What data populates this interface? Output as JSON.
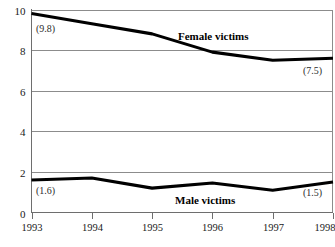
{
  "chart_data": {
    "type": "line",
    "title": "",
    "subtitle": "",
    "xlabel": "",
    "ylabel": "",
    "x": [
      "1993",
      "1994",
      "1995",
      "1996",
      "1997",
      "1998"
    ],
    "categories": [
      "1993",
      "1994",
      "1995",
      "1996",
      "1997",
      "1998"
    ],
    "series": [
      {
        "name": "Female victims",
        "label": "Female victims",
        "values": [
          9.8,
          9.3,
          8.8,
          7.9,
          7.5,
          7.6
        ],
        "endpoint_annotations": {
          "first": "(9.8)",
          "last": "(7.5)"
        }
      },
      {
        "name": "Male victims",
        "label": "Male victims",
        "values": [
          1.6,
          1.7,
          1.2,
          1.45,
          1.1,
          1.5
        ],
        "endpoint_annotations": {
          "first": "(1.6)",
          "last": "(1.5)"
        }
      }
    ],
    "ylim": [
      0,
      10
    ],
    "xlim": [
      "1993",
      "1998"
    ],
    "y_ticks": [
      "0",
      "2",
      "4",
      "6",
      "8",
      "10"
    ],
    "y_tick_values": [
      0,
      2,
      4,
      6,
      8,
      10
    ],
    "x_ticks": [
      "1993",
      "1994",
      "1995",
      "1996",
      "1997",
      "1998"
    ],
    "grid": "horizontal",
    "legend": "inline-labels",
    "colors": {
      "line": "#000000",
      "gridline": "#8c8c8c",
      "axis": "#6e6e6e",
      "background": "#ffffff",
      "text": "#1a1a1a"
    }
  },
  "annotations": {
    "female_start": "(9.8)",
    "female_end": "(7.5)",
    "male_start": "(1.6)",
    "male_end": "(1.5)",
    "female_label": "Female victims",
    "male_label": "Male victims"
  }
}
